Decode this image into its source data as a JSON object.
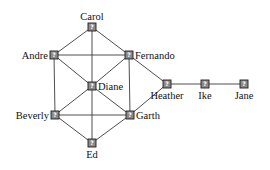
{
  "diagram": {
    "type": "network-graph",
    "node_icon": "unknown-person-icon",
    "node_glyph": "?",
    "colors": {
      "edge": "#3a3a3a",
      "node_fill": "#8a8a8a",
      "node_stroke": "#1e1e1e",
      "label": "#111111"
    },
    "nodes": [
      {
        "id": "carol",
        "label": "Carol",
        "x": 92,
        "y": 27,
        "label_pos": "top"
      },
      {
        "id": "andre",
        "label": "Andre",
        "x": 54,
        "y": 55,
        "label_pos": "left"
      },
      {
        "id": "fernando",
        "label": "Fernando",
        "x": 129,
        "y": 55,
        "label_pos": "right"
      },
      {
        "id": "diane",
        "label": "Diane",
        "x": 92,
        "y": 86,
        "label_pos": "right"
      },
      {
        "id": "beverly",
        "label": "Beverly",
        "x": 55,
        "y": 115,
        "label_pos": "left"
      },
      {
        "id": "garth",
        "label": "Garth",
        "x": 130,
        "y": 115,
        "label_pos": "right"
      },
      {
        "id": "ed",
        "label": "Ed",
        "x": 92,
        "y": 143,
        "label_pos": "bottom"
      },
      {
        "id": "heather",
        "label": "Heather",
        "x": 167,
        "y": 84,
        "label_pos": "bottom"
      },
      {
        "id": "ike",
        "label": "Ike",
        "x": 205,
        "y": 84,
        "label_pos": "bottom"
      },
      {
        "id": "jane",
        "label": "Jane",
        "x": 244,
        "y": 84,
        "label_pos": "bottom"
      }
    ],
    "edges": [
      [
        "andre",
        "beverly"
      ],
      [
        "andre",
        "carol"
      ],
      [
        "andre",
        "diane"
      ],
      [
        "andre",
        "fernando"
      ],
      [
        "beverly",
        "diane"
      ],
      [
        "beverly",
        "ed"
      ],
      [
        "beverly",
        "garth"
      ],
      [
        "carol",
        "diane"
      ],
      [
        "carol",
        "fernando"
      ],
      [
        "diane",
        "ed"
      ],
      [
        "diane",
        "fernando"
      ],
      [
        "diane",
        "garth"
      ],
      [
        "ed",
        "garth"
      ],
      [
        "fernando",
        "garth"
      ],
      [
        "fernando",
        "heather"
      ],
      [
        "garth",
        "heather"
      ],
      [
        "heather",
        "ike"
      ],
      [
        "ike",
        "jane"
      ]
    ]
  }
}
